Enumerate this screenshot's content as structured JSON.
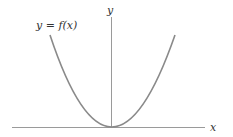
{
  "diagram": {
    "function_label": "y = f(x)",
    "x_axis_label": "x",
    "y_axis_label": "y",
    "curve_type": "parabola",
    "colors": {
      "curve": "#8a8a8a",
      "axes": "#9a9a9a",
      "text": "#333333"
    }
  }
}
